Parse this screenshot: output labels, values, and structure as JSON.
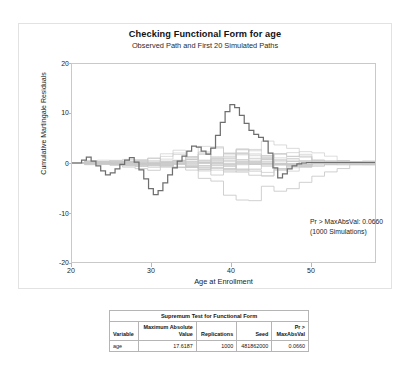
{
  "graph": {
    "title": "Checking Functional Form for age",
    "subtitle": "Observed Path and First 20 Simulated Paths",
    "xlabel": "Age at Enrollment",
    "ylabel": "Cumulative Martingale Residuals",
    "annotation_line1": "Pr > MaxAbsVal: 0.0660",
    "annotation_line2": "(1000 Simulations)",
    "observed_color": "#6b6b6b",
    "simulated_color": "#c8c8c8"
  },
  "chart_data": {
    "type": "line",
    "title": "Checking Functional Form for age",
    "subtitle": "Observed Path and First 20 Simulated Paths",
    "xlabel": "Age at Enrollment",
    "ylabel": "Cumulative Martingale Residuals",
    "xlim": [
      19,
      57
    ],
    "ylim": [
      -20,
      20
    ],
    "xticks": [
      20,
      30,
      40,
      50
    ],
    "yticks": [
      -20,
      -10,
      0,
      10,
      20
    ],
    "grid": false,
    "legend": "none",
    "annotations": [
      "Pr > MaxAbsVal: 0.0660",
      "(1000 Simulations)"
    ],
    "series": [
      {
        "name": "Observed Path",
        "style": "step",
        "emphasis": "bold",
        "x": [
          19.0,
          20.2,
          20.8,
          21.4,
          22.0,
          22.6,
          23.2,
          23.8,
          24.4,
          25.0,
          25.6,
          26.2,
          26.8,
          27.4,
          28.0,
          28.6,
          29.2,
          29.8,
          30.4,
          31.0,
          31.6,
          32.2,
          32.8,
          33.4,
          34.0,
          34.6,
          35.2,
          35.8,
          36.4,
          37.0,
          37.6,
          38.2,
          38.8,
          39.4,
          40.0,
          40.6,
          41.2,
          41.8,
          42.4,
          43.0,
          43.6,
          44.2,
          44.8,
          45.4,
          46.0,
          46.6,
          47.2,
          47.8,
          48.4,
          49.0,
          50.0,
          51.0,
          52.0,
          53.0,
          54.0,
          55.0,
          56.0,
          57.0
        ],
        "y": [
          0.0,
          0.6,
          1.2,
          0.4,
          -0.6,
          -1.6,
          -2.4,
          -2.0,
          -1.2,
          -0.3,
          0.6,
          1.1,
          0.2,
          -1.4,
          -3.2,
          -5.2,
          -6.4,
          -5.6,
          -4.0,
          -2.4,
          -1.0,
          0.4,
          1.4,
          2.4,
          3.4,
          3.2,
          2.4,
          1.8,
          3.0,
          5.6,
          8.2,
          10.4,
          11.8,
          11.2,
          9.6,
          8.0,
          6.6,
          5.8,
          5.2,
          4.4,
          2.0,
          -1.0,
          -3.0,
          -2.2,
          -1.2,
          -0.6,
          -0.2,
          0.0,
          0.1,
          0.1,
          0.1,
          0.1,
          0.1,
          0.1,
          0.1,
          0.1,
          0.1,
          0.1
        ]
      },
      {
        "name": "Simulated Paths",
        "style": "step",
        "emphasis": "light",
        "count": 20,
        "envelope_max": [
          2.0,
          3.5,
          5.0,
          6.0,
          7.0,
          8.0,
          9.0,
          10.0,
          12.0,
          14.0,
          16.0,
          17.0,
          17.5,
          17.0,
          16.0,
          15.0,
          13.0,
          11.0,
          9.0,
          7.0,
          5.0,
          3.5,
          2.0,
          1.0,
          0.5
        ],
        "envelope_min": [
          -2.0,
          -3.5,
          -5.0,
          -6.0,
          -7.0,
          -8.0,
          -9.5,
          -11.0,
          -13.0,
          -14.5,
          -15.5,
          -16.0,
          -16.5,
          -16.0,
          -15.0,
          -13.5,
          -12.0,
          -10.0,
          -8.0,
          -6.0,
          -4.0,
          -2.5,
          -1.5,
          -0.8,
          -0.4
        ]
      }
    ]
  },
  "table": {
    "caption": "Supremum Test for Functional Form",
    "columns": [
      "Variable",
      "Maximum Absolute\nValue",
      "Replications",
      "Seed",
      "Pr >\nMaxAbsVal"
    ],
    "column_labels": {
      "variable": "Variable",
      "max_abs_value_l1": "Maximum Absolute",
      "max_abs_value_l2": "Value",
      "replications": "Replications",
      "seed": "Seed",
      "pr_l1": "Pr >",
      "pr_l2": "MaxAbsVal"
    },
    "rows": [
      {
        "variable": "age",
        "max_abs_value": "17.6187",
        "replications": "1000",
        "seed": "481862000",
        "pr_max_abs_val": "0.0660"
      }
    ]
  },
  "axis": {
    "yticks": [
      "20",
      "10",
      "0",
      "-10",
      "-20"
    ],
    "xticks": [
      "20",
      "30",
      "40",
      "50"
    ]
  }
}
